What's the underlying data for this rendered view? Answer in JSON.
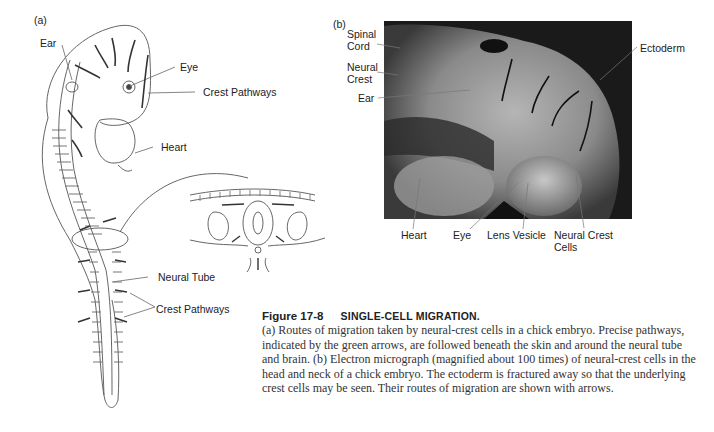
{
  "figure": {
    "number": "Figure 17-8",
    "title": "SINGLE-CELL MIGRATION.",
    "caption": "(a) Routes of migration taken by neural-crest cells in a chick embryo. Precise pathways, indicated by the green arrows, are followed beneath the skin and around the neural tube and brain. (b) Electron micrograph (magnified about 100 times) of neural-crest cells in the head and neck of a chick embryo. The ectoderm is fractured away so that the underlying crest cells may be seen. Their routes of migration are shown with arrows."
  },
  "panel_a": {
    "tag": "(a)",
    "labels": {
      "ear": "Ear",
      "eye": "Eye",
      "crest_pathways_top": "Crest Pathways",
      "heart": "Heart",
      "neural_tube": "Neural Tube",
      "crest_pathways_bottom": "Crest Pathways"
    }
  },
  "panel_b": {
    "tag": "(b)",
    "labels": {
      "spinal_cord_1": "Spinal",
      "spinal_cord_2": "Cord",
      "neural_crest_1": "Neural",
      "neural_crest_2": "Crest",
      "ear": "Ear",
      "ectoderm": "Ectoderm",
      "heart": "Heart",
      "eye": "Eye",
      "lens_vesicle": "Lens Vesicle",
      "neural_crest_cells_1": "Neural Crest",
      "neural_crest_cells_2": "Cells"
    }
  }
}
